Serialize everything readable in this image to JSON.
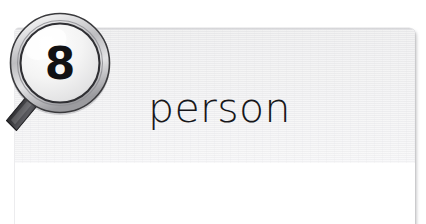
{
  "page": {
    "background_color": "#ffffff",
    "width": 426,
    "height": 224
  },
  "card": {
    "title": "person",
    "header_color": "#f0f0f1",
    "body_color": "#ffffff",
    "title_color": "#17171a",
    "shadow_color": "#8c8c91"
  },
  "badge": {
    "icon": "magnifier-icon",
    "number": "8",
    "number_color": "#111114",
    "rim_color": "#3a3a3d",
    "lens_color": "#f2f2f2",
    "handle_color": "#4a4a4e"
  }
}
